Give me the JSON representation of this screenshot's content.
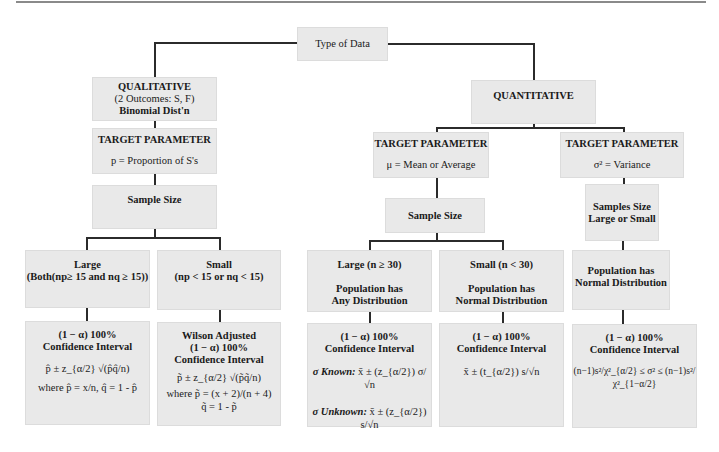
{
  "root": {
    "label": "Type of Data"
  },
  "qualitative": {
    "title": "QUALITATIVE",
    "subtitle": "(2 Outcomes: S, F)",
    "dist": "Binomial Dist'n",
    "target": {
      "title": "TARGET PARAMETER",
      "desc": "p = Proportion of S's"
    },
    "sample_size": {
      "label": "Sample Size"
    },
    "large": {
      "title": "Large",
      "condition": "(Both(np≥ 15 and nq ≥ 15))"
    },
    "small": {
      "title": "Small",
      "condition": "(np < 15 or nq < 15)"
    },
    "ci_large": {
      "title1": "(1 − α) 100%",
      "title2": "Confidence Interval",
      "formula": "p̂ ± z_{α/2} √(p̂q̂/n)",
      "where": "where p̂ = x/n, q̂ = 1 - p̂"
    },
    "ci_small": {
      "title0": "Wilson Adjusted",
      "title1": "(1 − α) 100%",
      "title2": "Confidence Interval",
      "formula": "p̃ ± z_{α/2} √(p̃q̃/n)",
      "where": "where p̃ = (x + 2)/(n + 4)",
      "q": "q̃ = 1 - p̃"
    }
  },
  "quantitative": {
    "title": "QUANTITATIVE",
    "mean": {
      "target": {
        "title": "TARGET PARAMETER",
        "desc": "μ = Mean or Average"
      },
      "sample_size": {
        "label": "Sample Size"
      },
      "large": {
        "title": "Large (n ≥ 30)",
        "pop1": "Population has",
        "pop2": "Any Distribution"
      },
      "small": {
        "title": "Small (n < 30)",
        "pop1": "Population has",
        "pop2": "Normal Distribution"
      },
      "ci_large": {
        "title1": "(1 − α) 100%",
        "title2": "Confidence Interval",
        "known_label": "σ Known:",
        "known_formula": "x̄ ± (z_{α/2}) σ/√n",
        "unknown_label": "σ Unknown:",
        "unknown_formula": "x̄ ± (z_{α/2}) s/√n"
      },
      "ci_small": {
        "title1": "(1 − α) 100%",
        "title2": "Confidence Interval",
        "formula": "x̄ ± (t_{α/2}) s/√n"
      }
    },
    "variance": {
      "target": {
        "title": "TARGET PARAMETER",
        "desc": "σ² = Variance"
      },
      "sample_size": {
        "line1": "Samples Size",
        "line2": "Large or Small"
      },
      "pop": {
        "line1": "Population has",
        "line2": "Normal Distribution"
      },
      "ci": {
        "title1": "(1 − α) 100%",
        "title2": "Confidence Interval",
        "formula": "(n−1)s²/χ²_{α/2} ≤ σ² ≤ (n−1)s²/χ²_{1−α/2}"
      }
    }
  },
  "colors": {
    "box_fill": "#e9e9e9",
    "line": "#2b2b2b",
    "text": "#1a1a1a"
  }
}
